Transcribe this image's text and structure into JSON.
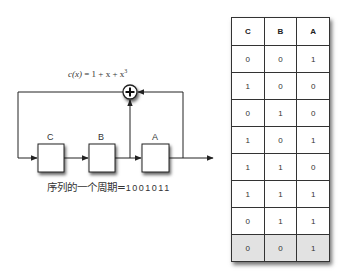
{
  "diagram": {
    "formula": {
      "lhs": "c(x)",
      "rhs": "= 1 + x + x",
      "exp": "3"
    },
    "registers": [
      {
        "label": "C"
      },
      {
        "label": "B"
      },
      {
        "label": "A"
      }
    ],
    "xor_symbol": "+",
    "caption": {
      "text": "序列的一个周期=",
      "sequence": "1001011"
    }
  },
  "table": {
    "headers": [
      "C",
      "B",
      "A"
    ],
    "rows": [
      [
        "0",
        "0",
        "1"
      ],
      [
        "1",
        "0",
        "0"
      ],
      [
        "0",
        "1",
        "0"
      ],
      [
        "1",
        "0",
        "1"
      ],
      [
        "1",
        "1",
        "0"
      ],
      [
        "1",
        "1",
        "1"
      ],
      [
        "0",
        "1",
        "1"
      ],
      [
        "0",
        "0",
        "1"
      ]
    ],
    "highlight_row_color": "#e2e2e2"
  }
}
